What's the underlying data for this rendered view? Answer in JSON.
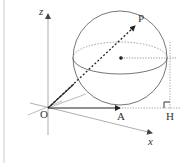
{
  "diagram": {
    "type": "3d-geometry-sphere",
    "labels": {
      "z_axis": "z",
      "x_axis": "x",
      "origin": "O",
      "point_A": "A",
      "point_P": "P",
      "point_H": "H"
    },
    "colors": {
      "line": "#555555",
      "light_line": "#aaaaaa",
      "vector": "#222222",
      "border": "#cccccc"
    },
    "elements": [
      "sphere",
      "equator-ellipse",
      "vector-OA",
      "vector-OP",
      "sphere-center",
      "perpendicular-to-H",
      "right-angle-marker-H"
    ]
  }
}
